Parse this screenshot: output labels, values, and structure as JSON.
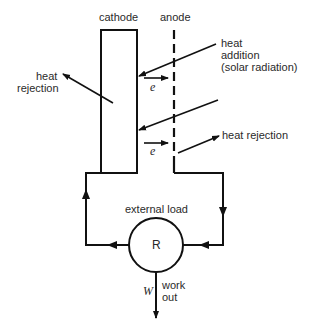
{
  "diagram": {
    "title_labels": {
      "cathode": "cathode",
      "anode": "anode"
    },
    "heat_addition": {
      "line1": "heat",
      "line2": "addition",
      "line3": "(solar radiation)"
    },
    "heat_rejection_left": {
      "line1": "heat",
      "line2": "rejection"
    },
    "heat_rejection_right": "heat rejection",
    "electron_labels": [
      "e",
      "e"
    ],
    "external_load": "external load",
    "resistor": "R",
    "work_symbol": "W",
    "work_out": {
      "line1": "work",
      "line2": "out"
    },
    "colors": {
      "stroke": "#111111",
      "text": "#2a2a2a",
      "background": "#ffffff"
    }
  }
}
